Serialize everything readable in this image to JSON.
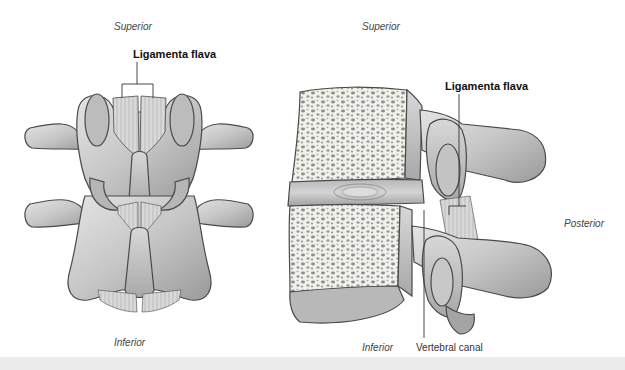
{
  "figure": {
    "left_view": {
      "name": "posterior view of lumbar vertebrae",
      "labels": {
        "superior": "Superior",
        "inferior": "Inferior",
        "ligamenta_flava": "Ligamenta flava"
      }
    },
    "right_view": {
      "name": "lateral view of lumbar vertebrae",
      "labels": {
        "superior": "Superior",
        "inferior": "Inferior",
        "posterior": "Posterior",
        "ligamenta_flava": "Ligamenta flava",
        "vertebral_canal": "Vertebral canal"
      }
    },
    "colors": {
      "bone_fill": "#c9c9c9",
      "bone_light": "#e2e2e2",
      "bone_dark": "#8c8c8c",
      "outline": "#4a4a4a",
      "cancellous_bg": "#f2f2ee",
      "trabeculae": "#8a8a8a",
      "footer_band": "#ebebeb"
    }
  }
}
